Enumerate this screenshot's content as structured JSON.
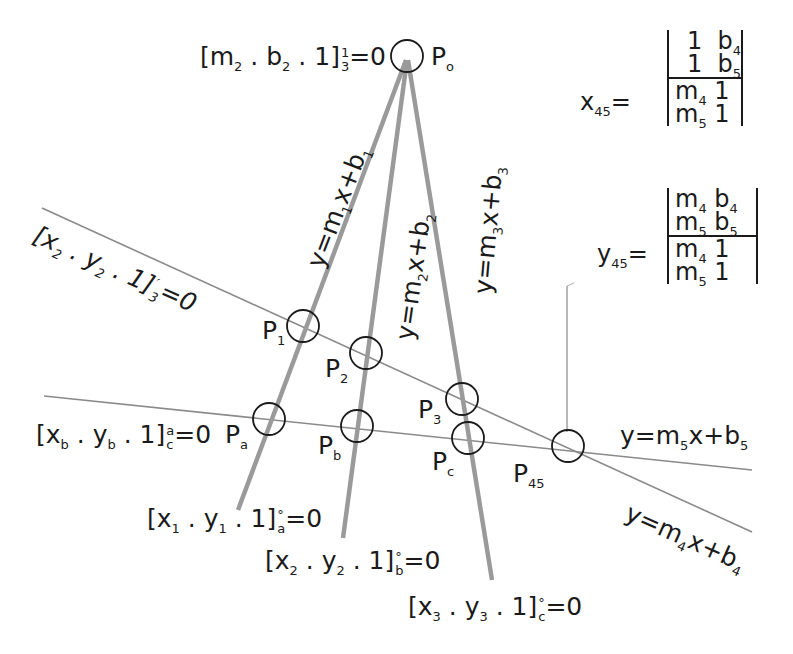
{
  "diagram": {
    "points": [
      {
        "id": "P0",
        "label": "P",
        "sub": "o"
      },
      {
        "id": "P1",
        "label": "P",
        "sub": "1"
      },
      {
        "id": "P2",
        "label": "P",
        "sub": "2"
      },
      {
        "id": "P3",
        "label": "P",
        "sub": "3"
      },
      {
        "id": "Pa",
        "label": "P",
        "sub": "a"
      },
      {
        "id": "Pb",
        "label": "P",
        "sub": "b"
      },
      {
        "id": "Pc",
        "label": "P",
        "sub": "c"
      },
      {
        "id": "P45",
        "label": "P",
        "sub": "45"
      }
    ],
    "line_equations": {
      "l1": {
        "pre": "y=m",
        "sub1": "1",
        "mid": "x+b",
        "sub2": "1"
      },
      "l2": {
        "pre": "y=m",
        "sub1": "2",
        "mid": "x+b",
        "sub2": "2"
      },
      "l3": {
        "pre": "y=m",
        "sub1": "3",
        "mid": "x+b",
        "sub2": "3"
      },
      "l4": {
        "pre": "y=m",
        "sub1": "4",
        "mid": "x+b",
        "sub2": "4"
      },
      "l5": {
        "pre": "y=m",
        "sub1": "5",
        "mid": "x+b",
        "sub2": "5"
      }
    },
    "bracket_equations": {
      "apex": {
        "body": "[m",
        "s1": "2",
        "dot1": " . b",
        "s2": "2",
        "tail": " . 1]",
        "sup": "1",
        "sub": "3",
        "rhs": "=0"
      },
      "upper_line": {
        "body": "[x",
        "s1": "2",
        "dot1": " . y",
        "s2": "2",
        "tail": " . 1]",
        "sup": "′",
        "sub": "3",
        "rhs": "=0"
      },
      "lower_line": {
        "body": "[x",
        "s1": "b",
        "dot1": " . y",
        "s2": "b",
        "tail": " . 1]",
        "sup": "a",
        "sub": "c",
        "rhs": "=0"
      },
      "line1_end": {
        "body": "[x",
        "s1": "1",
        "dot1": " . y",
        "s2": "1",
        "tail": " . 1]",
        "sup": "°",
        "sub": "a",
        "rhs": "=0"
      },
      "line2_end": {
        "body": "[x",
        "s1": "2",
        "dot1": " . y",
        "s2": "2",
        "tail": " . 1]",
        "sup": "°",
        "sub": "b",
        "rhs": "=0"
      },
      "line3_end": {
        "body": "[x",
        "s1": "3",
        "dot1": " . y",
        "s2": "3",
        "tail": " . 1]",
        "sup": "°",
        "sub": "c",
        "rhs": "=0"
      }
    },
    "determinants": {
      "x45": {
        "lhs": "x",
        "lhs_sub": "45",
        "eq": "=",
        "numerator": [
          {
            "a": "1",
            "b": "b",
            "b_sub": "4"
          },
          {
            "a": "1",
            "b": "b",
            "b_sub": "5"
          }
        ],
        "denominator": [
          {
            "a": "m",
            "a_sub": "4",
            "b": "1"
          },
          {
            "a": "m",
            "a_sub": "5",
            "b": "1"
          }
        ]
      },
      "y45": {
        "lhs": "y",
        "lhs_sub": "45",
        "eq": "=",
        "numerator": [
          {
            "a": "m",
            "a_sub": "4",
            "b": "b",
            "b_sub": "4"
          },
          {
            "a": "m",
            "a_sub": "5",
            "b": "b",
            "b_sub": "5"
          }
        ],
        "denominator": [
          {
            "a": "m",
            "a_sub": "4",
            "b": "1"
          },
          {
            "a": "m",
            "a_sub": "5",
            "b": "1"
          }
        ]
      }
    },
    "colors": {
      "thick_line": "#9a9a9a",
      "thin_line": "#8a8a8a",
      "circle": "#1a1a1a",
      "text": "#1a1a1a"
    }
  }
}
